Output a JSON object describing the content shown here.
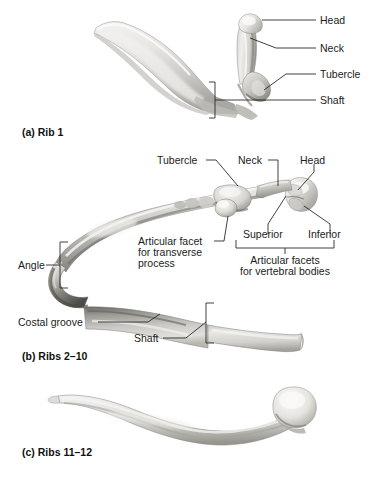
{
  "figure": {
    "background_color": "#ffffff",
    "label_color": "#1b1b1b",
    "leader_color": "#2a2a2a",
    "bone_light": "#f0efed",
    "bone_mid": "#cfcdc9",
    "bone_dark": "#8f8d88",
    "bone_shadow": "#5d5b57"
  },
  "panels": [
    {
      "id": "panel-a",
      "caption": "(a) Rib 1",
      "labels": [
        {
          "id": "head",
          "text": "Head"
        },
        {
          "id": "neck",
          "text": "Neck"
        },
        {
          "id": "tubercle",
          "text": "Tubercle"
        },
        {
          "id": "shaft",
          "text": "Shaft"
        }
      ]
    },
    {
      "id": "panel-b",
      "caption": "(b) Ribs 2–10",
      "labels": [
        {
          "id": "tubercle",
          "text": "Tubercle"
        },
        {
          "id": "neck",
          "text": "Neck"
        },
        {
          "id": "head",
          "text": "Head"
        },
        {
          "id": "superior",
          "text": "Superior"
        },
        {
          "id": "inferior",
          "text": "Inferior"
        },
        {
          "id": "articular-facet-transverse-line1",
          "text": "Articular facet"
        },
        {
          "id": "articular-facet-transverse-line2",
          "text": "for transverse"
        },
        {
          "id": "articular-facet-transverse-line3",
          "text": "process"
        },
        {
          "id": "articular-facets-vertebral-line1",
          "text": "Articular facets"
        },
        {
          "id": "articular-facets-vertebral-line2",
          "text": "for vertebral bodies"
        },
        {
          "id": "angle",
          "text": "Angle"
        },
        {
          "id": "costal-groove",
          "text": "Costal groove"
        },
        {
          "id": "shaft",
          "text": "Shaft"
        }
      ]
    },
    {
      "id": "panel-c",
      "caption": "(c) Ribs 11–12",
      "labels": []
    }
  ]
}
